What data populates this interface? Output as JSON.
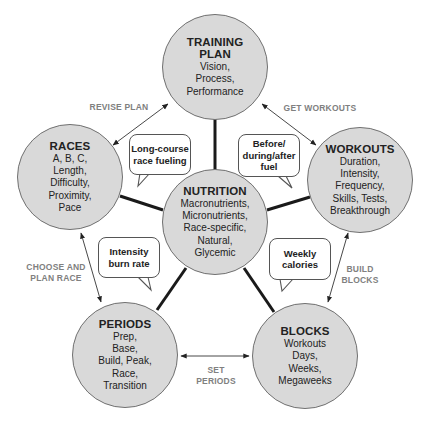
{
  "nodes": {
    "training_plan": {
      "title": "TRAINING\nPLAN",
      "body": "Vision,\nProcess,\nPerformance"
    },
    "races": {
      "title": "RACES",
      "body": "A, B, C,\nLength,\nDifficulty,\nProximity,\nPace"
    },
    "workouts": {
      "title": "WORKOUTS",
      "body": "Duration,\nIntensity,\nFrequency,\nSkills, Tests,\nBreakthrough"
    },
    "nutrition": {
      "title": "NUTRITION",
      "body": "Macronutrients,\nMicronutrients,\nRace-specific,\nNatural,\nGlycemic"
    },
    "periods": {
      "title": "PERIODS",
      "body": "Prep,\nBase,\nBuild, Peak,\nRace,\nTransition"
    },
    "blocks": {
      "title": "BLOCKS",
      "body": "Workouts\nDays,\nWeeks,\nMegaweeks"
    }
  },
  "callouts": {
    "races_nutrition": "Long-course\nrace fueling",
    "workouts_nutrition": "Before/\nduring/after\nfuel",
    "periods_nutrition": "Intensity\nburn rate",
    "blocks_nutrition": "Weekly\ncalories"
  },
  "edge_labels": {
    "revise_plan": "REVISE PLAN",
    "get_workouts": "GET WORKOUTS",
    "choose_and_plan_race": "CHOOSE AND\nPLAN RACE",
    "build_blocks": "BUILD\nBLOCKS",
    "set_periods": "SET\nPERIODS"
  },
  "colors": {
    "node_fill": "#d9d9d9",
    "node_stroke": "#707070",
    "connector": "#1a1a1a",
    "arrow": "#333333",
    "edge_label": "#808080"
  }
}
